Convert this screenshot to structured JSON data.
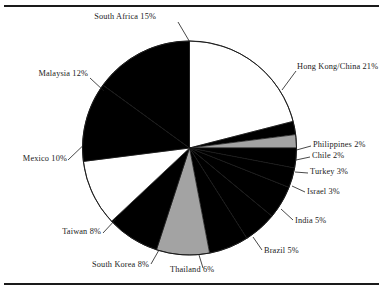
{
  "figure": {
    "type": "pie-chart-figure",
    "has_top_rule": true,
    "has_bottom_rule": true,
    "background_color": "#ffffff",
    "line_color": "#1a1a1a"
  },
  "chart_data": {
    "type": "pie",
    "title": "",
    "xlabel": "",
    "ylabel": "",
    "legend_position": "none",
    "labels_outside": true,
    "start_angle_deg": 0,
    "direction": "clockwise",
    "total_percent": 100,
    "categories": [
      "Hong Kong/China",
      "Philippines",
      "Chile",
      "Turkey",
      "Israel",
      "India",
      "Brazil",
      "Thailand",
      "South Korea",
      "Taiwan",
      "Mexico",
      "Malaysia",
      "South Africa"
    ],
    "values": [
      21,
      2,
      2,
      3,
      3,
      5,
      5,
      6,
      8,
      8,
      10,
      12,
      15
    ],
    "slice_colors": [
      "#ffffff",
      "#000000",
      "#a3a3a3",
      "#000000",
      "#000000",
      "#000000",
      "#000000",
      "#000000",
      "#a3a3a3",
      "#000000",
      "#ffffff",
      "#000000",
      "#000000"
    ],
    "slices": [
      {
        "label": "Hong Kong/China  21%",
        "name": "Hong Kong/China",
        "value": 21,
        "fill": "#ffffff"
      },
      {
        "label": "Philippines  2%",
        "name": "Philippines",
        "value": 2,
        "fill": "#000000"
      },
      {
        "label": "Chile  2%",
        "name": "Chile",
        "value": 2,
        "fill": "#a3a3a3"
      },
      {
        "label": "Turkey  3%",
        "name": "Turkey",
        "value": 3,
        "fill": "#000000"
      },
      {
        "label": "Israel  3%",
        "name": "Israel",
        "value": 3,
        "fill": "#000000"
      },
      {
        "label": "India  5%",
        "name": "India",
        "value": 5,
        "fill": "#000000"
      },
      {
        "label": "Brazil  5%",
        "name": "Brazil",
        "value": 5,
        "fill": "#000000"
      },
      {
        "label": "Thailand  6%",
        "name": "Thailand",
        "value": 6,
        "fill": "#000000"
      },
      {
        "label": "South Korea  8%",
        "name": "South Korea",
        "value": 8,
        "fill": "#a3a3a3"
      },
      {
        "label": "Taiwan  8%",
        "name": "Taiwan",
        "value": 8,
        "fill": "#000000"
      },
      {
        "label": "Mexico  10%",
        "name": "Mexico",
        "value": 10,
        "fill": "#ffffff"
      },
      {
        "label": "Malaysia  12%",
        "name": "Malaysia",
        "value": 12,
        "fill": "#000000"
      },
      {
        "label": "South Africa  15%",
        "name": "South Africa",
        "value": 15,
        "fill": "#000000"
      }
    ]
  },
  "labels": {
    "south_africa": "South Africa  15%",
    "hong_kong": "Hong Kong/China  21%",
    "malaysia": "Malaysia  12%",
    "mexico": "Mexico  10%",
    "taiwan": "Taiwan  8%",
    "south_korea": "South Korea  8%",
    "thailand": "Thailand  6%",
    "brazil": "Brazil  5%",
    "india": "India  5%",
    "israel": "Israel  3%",
    "turkey": "Turkey  3%",
    "chile": "Chile  2%",
    "philippines": "Philippines  2%"
  }
}
